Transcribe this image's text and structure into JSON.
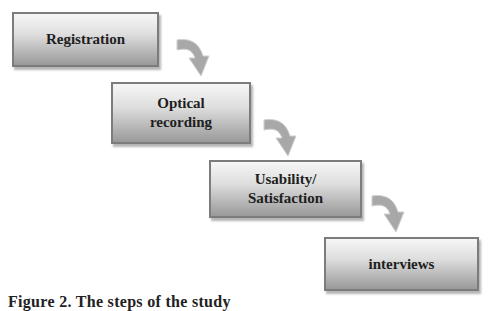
{
  "diagram": {
    "type": "process-flow",
    "steps": [
      {
        "label": "Registration"
      },
      {
        "label": "Optical\nrecording"
      },
      {
        "label": "Usability/\nSatisfaction"
      },
      {
        "label": "interviews"
      }
    ],
    "arrow_icon": "curved-down-arrow-icon",
    "colors": {
      "box_top": "#f6f6f6",
      "box_bottom": "#9a9a9a",
      "box_border": "#7c7c7c",
      "arrow": "#a8a8a8",
      "text": "#1e1e1e"
    }
  },
  "caption": {
    "text": "Figure 2. The steps of the study"
  }
}
